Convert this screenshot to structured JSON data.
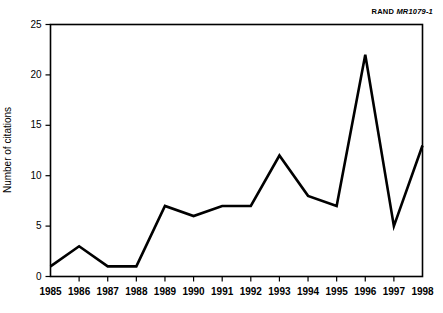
{
  "credit": {
    "org": "RAND",
    "id": "MR1079-1"
  },
  "chart_data": {
    "type": "line",
    "title": "",
    "xlabel": "",
    "ylabel": "Number of citations",
    "categories": [
      "1985",
      "1986",
      "1987",
      "1988",
      "1989",
      "1990",
      "1991",
      "1992",
      "1993",
      "1994",
      "1995",
      "1996",
      "1997",
      "1998"
    ],
    "values": [
      1,
      3,
      1,
      1,
      7,
      6,
      7,
      7,
      12,
      8,
      7,
      22,
      5,
      13
    ],
    "x": [
      1985,
      1986,
      1987,
      1988,
      1989,
      1990,
      1991,
      1992,
      1993,
      1994,
      1995,
      1996,
      1997,
      1998
    ],
    "ylim": [
      0,
      25
    ],
    "yticks": [
      0,
      5,
      10,
      15,
      20,
      25
    ],
    "ytick_labels": [
      "0",
      "5",
      "10",
      "15",
      "20",
      "25"
    ],
    "grid": false,
    "legend": false,
    "series_color": "#000000"
  }
}
